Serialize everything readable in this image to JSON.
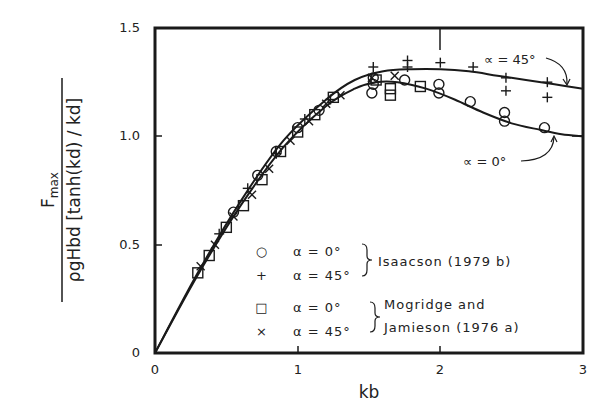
{
  "chart_data": {
    "type": "scatter",
    "title": "",
    "xlabel": "kb",
    "ylabel_numerator": "F",
    "ylabel_numerator_sub": "max",
    "ylabel_denominator": "ρgHbd [tanh(kd) / kd]",
    "xlim": [
      0,
      3
    ],
    "ylim": [
      0,
      1.5
    ],
    "grid": false,
    "x_ticks": [
      "0",
      "1",
      "2",
      "3"
    ],
    "y_ticks": [
      "0",
      "0.5",
      "1.0",
      "1.5"
    ],
    "legend_position": "lower-center inside plot",
    "legend": {
      "groups": [
        {
          "source": "Isaacson (1979 b)",
          "entries": [
            {
              "marker": "○",
              "label": "α = 0°"
            },
            {
              "marker": "+",
              "label": "α = 45°"
            }
          ]
        },
        {
          "source_line1": "Mogridge and",
          "source_line2": "Jamieson (1976 a)",
          "entries": [
            {
              "marker": "□",
              "label": "α = 0°"
            },
            {
              "marker": "×",
              "label": "α = 45°"
            }
          ]
        }
      ]
    },
    "annotations": [
      {
        "text": "∝ = 45°",
        "points_to": "upper curve near kb=2.6"
      },
      {
        "text": "∝ = 0°",
        "points_to": "lower curve near kb=2.7"
      }
    ],
    "curves": [
      {
        "name": "α = 45° (theory)",
        "x": [
          0,
          0.3,
          0.6,
          0.9,
          1.2,
          1.4,
          1.6,
          1.8,
          2.0,
          2.2,
          2.4,
          2.6,
          2.8,
          3.0
        ],
        "y": [
          0,
          0.37,
          0.7,
          0.98,
          1.17,
          1.26,
          1.3,
          1.31,
          1.31,
          1.3,
          1.28,
          1.26,
          1.24,
          1.22
        ]
      },
      {
        "name": "α = 0° (theory)",
        "x": [
          0,
          0.3,
          0.6,
          0.9,
          1.2,
          1.4,
          1.55,
          1.7,
          1.9,
          2.1,
          2.3,
          2.5,
          2.7,
          2.85,
          3.0
        ],
        "y": [
          0,
          0.36,
          0.68,
          0.95,
          1.14,
          1.22,
          1.25,
          1.25,
          1.22,
          1.17,
          1.11,
          1.06,
          1.03,
          1.01,
          1.0
        ]
      }
    ],
    "series": [
      {
        "name": "Isaacson (1979b) α = 0°",
        "marker": "circle",
        "points": [
          [
            0.55,
            0.65
          ],
          [
            0.72,
            0.82
          ],
          [
            0.85,
            0.93
          ],
          [
            1.0,
            1.04
          ],
          [
            1.15,
            1.12
          ],
          [
            1.53,
            1.24
          ],
          [
            1.52,
            1.2
          ],
          [
            1.53,
            1.27
          ],
          [
            1.75,
            1.26
          ],
          [
            1.99,
            1.24
          ],
          [
            1.99,
            1.2
          ],
          [
            2.21,
            1.16
          ],
          [
            2.45,
            1.11
          ],
          [
            2.45,
            1.07
          ],
          [
            2.73,
            1.04
          ]
        ]
      },
      {
        "name": "Isaacson (1979b) α = 45°",
        "marker": "plus",
        "points": [
          [
            0.45,
            0.55
          ],
          [
            0.65,
            0.76
          ],
          [
            0.85,
            0.92
          ],
          [
            1.05,
            1.08
          ],
          [
            1.23,
            1.17
          ],
          [
            1.53,
            1.32
          ],
          [
            1.77,
            1.35
          ],
          [
            1.77,
            1.32
          ],
          [
            2.0,
            1.34
          ],
          [
            2.23,
            1.32
          ],
          [
            2.46,
            1.27
          ],
          [
            2.46,
            1.21
          ],
          [
            2.75,
            1.25
          ],
          [
            2.75,
            1.18
          ]
        ]
      },
      {
        "name": "Mogridge and Jamieson (1976a) α = 0°",
        "marker": "square",
        "points": [
          [
            0.3,
            0.37
          ],
          [
            0.38,
            0.45
          ],
          [
            0.5,
            0.58
          ],
          [
            0.62,
            0.68
          ],
          [
            0.75,
            0.8
          ],
          [
            0.88,
            0.93
          ],
          [
            1.0,
            1.02
          ],
          [
            1.12,
            1.1
          ],
          [
            1.25,
            1.18
          ],
          [
            1.55,
            1.26
          ],
          [
            1.65,
            1.22
          ],
          [
            1.65,
            1.19
          ],
          [
            1.86,
            1.23
          ]
        ]
      },
      {
        "name": "Mogridge and Jamieson (1976a) α = 45°",
        "marker": "x",
        "points": [
          [
            0.32,
            0.4
          ],
          [
            0.42,
            0.5
          ],
          [
            0.55,
            0.63
          ],
          [
            0.68,
            0.73
          ],
          [
            0.8,
            0.85
          ],
          [
            0.95,
            0.98
          ],
          [
            1.08,
            1.07
          ],
          [
            1.2,
            1.15
          ],
          [
            1.3,
            1.19
          ],
          [
            1.52,
            1.27
          ],
          [
            1.68,
            1.28
          ]
        ]
      }
    ]
  },
  "labels": {
    "xlabel": "kb",
    "y_num": "F",
    "y_num_sub": "max",
    "y_den": "ρgHbd [tanh(kd) / kd]",
    "xt0": "0",
    "xt1": "1",
    "xt2": "2",
    "xt3": "3",
    "yt0": "0",
    "yt1": "0.5",
    "yt2": "1.0",
    "yt3": "1.5",
    "leg_circle": "○",
    "leg_plus": "+",
    "leg_square": "□",
    "leg_x": "×",
    "leg_a0": "α = 0°",
    "leg_a45": "α = 45°",
    "leg_a0b": "α = 0°",
    "leg_a45b": "α = 45°",
    "leg_src1": "Isaacson (1979 b)",
    "leg_src2a": "Mogridge and",
    "leg_src2b": "Jamieson (1976 a)",
    "anno45": "∝ = 45°",
    "anno0": "∝ = 0°"
  }
}
